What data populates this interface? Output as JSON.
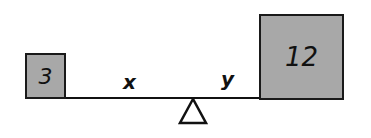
{
  "diagram": {
    "type": "balance-beam",
    "left_weight": "3",
    "right_weight": "12",
    "left_distance_label": "x",
    "right_distance_label": "y"
  }
}
